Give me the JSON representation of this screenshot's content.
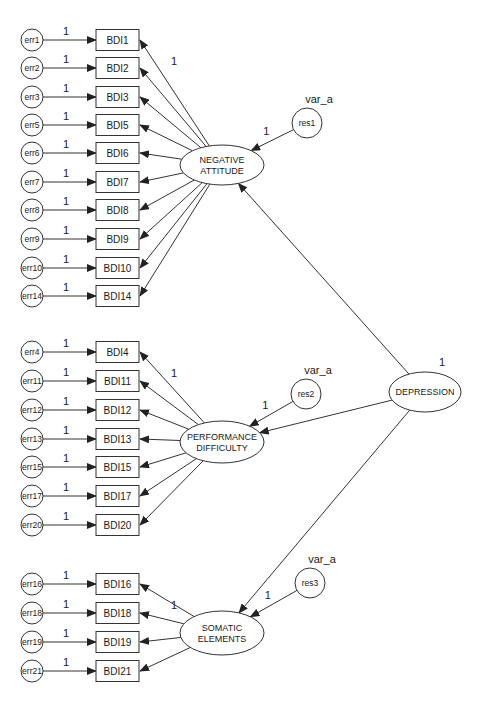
{
  "diagram": {
    "colors": {
      "stroke": "#333333",
      "text": "#1a1a1a",
      "background": "#ffffff"
    },
    "second_order_factor": {
      "id": "DEPRESSION",
      "label": "DEPRESSION",
      "variance_label": "1",
      "cx": 425,
      "cy": 392,
      "rx": 36,
      "ry": 20
    },
    "factors": [
      {
        "id": "NA",
        "label_lines": [
          "NEGATIVE",
          "ATTITUDE"
        ],
        "cx": 222,
        "cy": 165,
        "rx": 42,
        "ry": 20,
        "residual": {
          "label": "res1",
          "variance_label": "var_a",
          "path_weight": "1",
          "cx": 307,
          "cy": 123,
          "r": 15
        },
        "first_loading_label": "1",
        "indicators": [
          {
            "label": "BDI1",
            "error": "err1",
            "weight": "1",
            "y": 40
          },
          {
            "label": "BDI2",
            "error": "err2",
            "weight": "1",
            "y": 68
          },
          {
            "label": "BDI3",
            "error": "err3",
            "weight": "1",
            "y": 97
          },
          {
            "label": "BDI5",
            "error": "err5",
            "weight": "1",
            "y": 125
          },
          {
            "label": "BDI6",
            "error": "err6",
            "weight": "1",
            "y": 153
          },
          {
            "label": "BDI7",
            "error": "err7",
            "weight": "1",
            "y": 182
          },
          {
            "label": "BDI8",
            "error": "err8",
            "weight": "1",
            "y": 210
          },
          {
            "label": "BDI9",
            "error": "err9",
            "weight": "1",
            "y": 239
          },
          {
            "label": "BDI10",
            "error": "err10",
            "weight": "1",
            "y": 268
          },
          {
            "label": "BDI14",
            "error": "err14",
            "weight": "1",
            "y": 296
          }
        ]
      },
      {
        "id": "PD",
        "label_lines": [
          "PERFORMANCE",
          "DIFFICULTY"
        ],
        "cx": 222,
        "cy": 442,
        "rx": 42,
        "ry": 21,
        "residual": {
          "label": "res2",
          "variance_label": "var_a",
          "path_weight": "1",
          "cx": 306,
          "cy": 394,
          "r": 15
        },
        "first_loading_label": "1",
        "indicators": [
          {
            "label": "BDI4",
            "error": "err4",
            "weight": "1",
            "y": 352
          },
          {
            "label": "BDI11",
            "error": "err11",
            "weight": "1",
            "y": 381
          },
          {
            "label": "BDI12",
            "error": "err12",
            "weight": "1",
            "y": 410
          },
          {
            "label": "BDI13",
            "error": "err13",
            "weight": "1",
            "y": 439
          },
          {
            "label": "BDI15",
            "error": "err15",
            "weight": "1",
            "y": 467
          },
          {
            "label": "BDI17",
            "error": "err17",
            "weight": "1",
            "y": 496
          },
          {
            "label": "BDI20",
            "error": "err20",
            "weight": "1",
            "y": 525
          }
        ]
      },
      {
        "id": "SE",
        "label_lines": [
          "SOMATIC",
          "ELEMENTS"
        ],
        "cx": 222,
        "cy": 633,
        "rx": 42,
        "ry": 22,
        "residual": {
          "label": "res3",
          "variance_label": "var_a",
          "path_weight": "1",
          "cx": 310,
          "cy": 583,
          "r": 15
        },
        "first_loading_label": "1",
        "indicators": [
          {
            "label": "BDI16",
            "error": "err16",
            "weight": "1",
            "y": 584
          },
          {
            "label": "BDI18",
            "error": "err18",
            "weight": "1",
            "y": 613
          },
          {
            "label": "BDI19",
            "error": "err19",
            "weight": "1",
            "y": 642
          },
          {
            "label": "BDI21",
            "error": "err21",
            "weight": "1",
            "y": 671
          }
        ]
      }
    ]
  }
}
